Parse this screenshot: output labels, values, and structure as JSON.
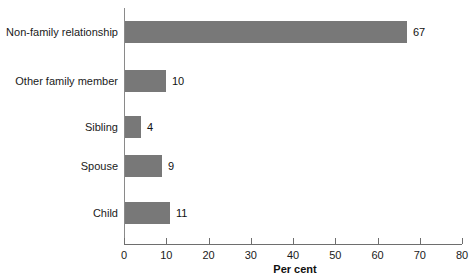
{
  "chart_data": {
    "type": "bar",
    "orientation": "horizontal",
    "title": "",
    "xlabel": "Per cent",
    "ylabel": "",
    "xlim": [
      0,
      80
    ],
    "xticks": [
      0,
      10,
      20,
      30,
      40,
      50,
      60,
      70,
      80
    ],
    "xticklabels": [
      "0",
      "10",
      "20",
      "30",
      "40",
      "50",
      "60",
      "70",
      "80"
    ],
    "grid": false,
    "legend": false,
    "bar_color": "#787878",
    "categories": [
      "Non-family relationship",
      "Other family member",
      "Sibling",
      "Spouse",
      "Child"
    ],
    "values": [
      67,
      10,
      4,
      9,
      11
    ],
    "value_labels": [
      "67",
      "10",
      "4",
      "9",
      "11"
    ]
  },
  "axis": {
    "xlabel": "Per cent"
  }
}
